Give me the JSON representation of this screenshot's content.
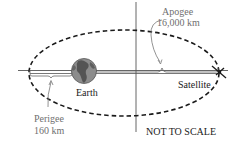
{
  "diagram": {
    "labels": {
      "apogee_title": "Apogee",
      "apogee_value": "16,000 km",
      "perigee_title": "Perigee",
      "perigee_value": "160 km",
      "earth": "Earth",
      "satellite": "Satellite",
      "scale_note": "NOT TO SCALE"
    },
    "colors": {
      "orbit": "#1a1a1a",
      "axis": "#555555",
      "earth_fill": "#8c8c8c",
      "earth_land": "#3a3a3a",
      "label_gray": "#6f6f6f",
      "label_black": "#1a1a1a"
    },
    "icons": {
      "earth": "earth-globe-icon",
      "satellite": "satellite-icon"
    }
  }
}
